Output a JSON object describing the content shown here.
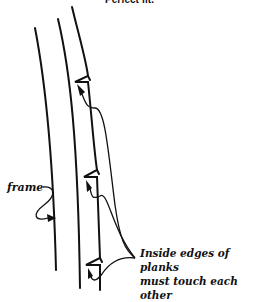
{
  "title": "Perfect fit.",
  "labels": {
    "frame": "frame",
    "note_line1": "Inside edges of planks",
    "note_line2": "must touch each other"
  }
}
